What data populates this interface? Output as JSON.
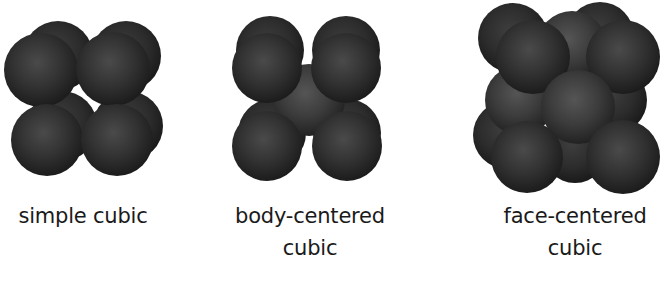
{
  "figure": {
    "colors": {
      "background": "#ffffff",
      "sphere_highlight": "#4c4c4c",
      "sphere_mid": "#2f2f2f",
      "sphere_edge": "#1a1a1a",
      "caption_text": "#1a1a1a"
    },
    "lattices": [
      {
        "id": "simple-cubic",
        "caption_lines": [
          "simple cubic"
        ],
        "sphere_count_visible": 8
      },
      {
        "id": "body-centered-cubic",
        "caption_lines": [
          "body-centered",
          "cubic"
        ],
        "sphere_count_visible": 9
      },
      {
        "id": "face-centered-cubic",
        "caption_lines": [
          "face-centered",
          "cubic"
        ],
        "sphere_count_visible": 13
      }
    ]
  }
}
